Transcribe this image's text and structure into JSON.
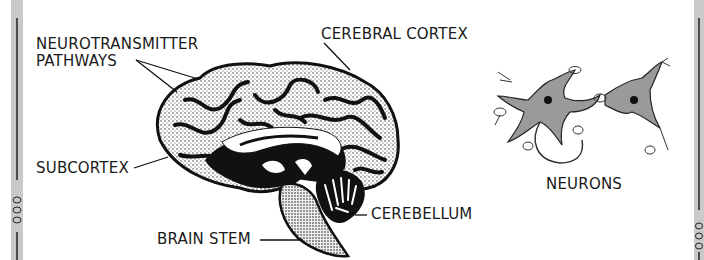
{
  "diagram": {
    "labels": {
      "neurotransmitter_line1": "NEUROTRANSMITTER",
      "neurotransmitter_line2": "PATHWAYS",
      "cerebral_cortex": "CEREBRAL CORTEX",
      "subcortex": "SUBCORTEX",
      "cerebellum": "CEREBELLUM",
      "brain_stem": "BRAIN STEM",
      "neurons": "NEURONS"
    },
    "colors": {
      "ink": "#111111",
      "stipple_fill": "#d8d8d8",
      "border_gray": "#c9c9c9",
      "background": "#ffffff"
    }
  }
}
